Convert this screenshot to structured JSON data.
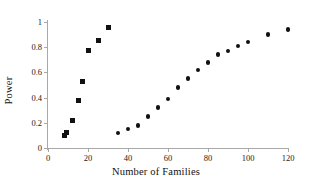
{
  "chart_data": {
    "type": "scatter",
    "title": "",
    "xlabel": "Number of Families",
    "ylabel": "Power",
    "xlim": [
      0,
      120
    ],
    "ylim": [
      0,
      1
    ],
    "xticks": [
      0,
      20,
      40,
      60,
      80,
      100,
      120
    ],
    "yticks": [
      0,
      0.2,
      0.4,
      0.6,
      0.8,
      1
    ],
    "xtick_labels": [
      "0",
      "20",
      "40",
      "60",
      "80",
      "100",
      "120"
    ],
    "ytick_labels": [
      "0",
      "0.2",
      "0.4",
      "0.6",
      "0.8",
      "1"
    ],
    "grid": false,
    "legend": null,
    "marker_color": "#111111",
    "axis_color": "#a8a8a8",
    "series": [
      {
        "name": "series-square",
        "marker": "square",
        "points": [
          {
            "x": 8,
            "y": 0.1
          },
          {
            "x": 9,
            "y": 0.12
          },
          {
            "x": 12,
            "y": 0.22
          },
          {
            "x": 15,
            "y": 0.38
          },
          {
            "x": 17,
            "y": 0.53
          },
          {
            "x": 20,
            "y": 0.77
          },
          {
            "x": 25,
            "y": 0.85
          },
          {
            "x": 30,
            "y": 0.96
          }
        ]
      },
      {
        "name": "series-circle",
        "marker": "circle",
        "points": [
          {
            "x": 35,
            "y": 0.12
          },
          {
            "x": 40,
            "y": 0.15
          },
          {
            "x": 45,
            "y": 0.18
          },
          {
            "x": 50,
            "y": 0.25
          },
          {
            "x": 55,
            "y": 0.32
          },
          {
            "x": 60,
            "y": 0.39
          },
          {
            "x": 65,
            "y": 0.48
          },
          {
            "x": 70,
            "y": 0.55
          },
          {
            "x": 75,
            "y": 0.62
          },
          {
            "x": 80,
            "y": 0.68
          },
          {
            "x": 85,
            "y": 0.74
          },
          {
            "x": 90,
            "y": 0.77
          },
          {
            "x": 95,
            "y": 0.81
          },
          {
            "x": 100,
            "y": 0.84
          },
          {
            "x": 110,
            "y": 0.9
          },
          {
            "x": 120,
            "y": 0.94
          }
        ]
      }
    ]
  }
}
